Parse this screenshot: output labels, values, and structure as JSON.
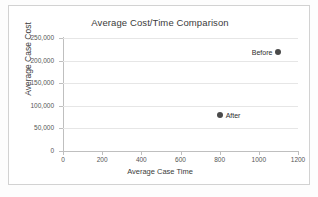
{
  "chart_data": {
    "type": "scatter",
    "title": "Average Cost/Time Comparison",
    "xlabel": "Average Case Time",
    "ylabel": "Average Case Cost",
    "xlim": [
      0,
      1200
    ],
    "ylim": [
      0,
      250000
    ],
    "x_ticks": [
      "0",
      "200",
      "400",
      "600",
      "800",
      "1000",
      "1200"
    ],
    "x_tick_values": [
      0,
      200,
      400,
      600,
      800,
      1000,
      1200
    ],
    "y_ticks": [
      "0",
      "50,000",
      "100,000",
      "150,000",
      "200,000",
      "250,000"
    ],
    "y_tick_values": [
      0,
      50000,
      100000,
      150000,
      200000,
      250000
    ],
    "grid": "horizontal",
    "legend": "none",
    "marker_color": "#4a4a4a",
    "points": [
      {
        "label": "Before",
        "x": 1100,
        "y": 220000,
        "label_side": "left"
      },
      {
        "label": "After",
        "x": 800,
        "y": 80000,
        "label_side": "right"
      }
    ]
  }
}
